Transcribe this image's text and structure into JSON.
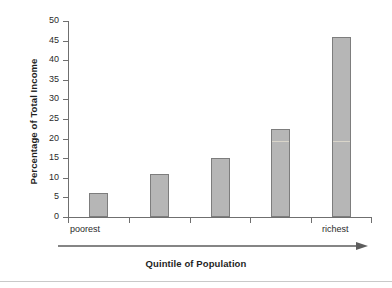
{
  "chart_data": {
    "type": "bar",
    "title": "",
    "xlabel": "Quintile of Population",
    "ylabel": "Percentage of Total Income",
    "categories": [
      "poorest",
      "",
      "",
      "",
      "richest"
    ],
    "values": [
      6,
      11,
      15,
      22.5,
      46
    ],
    "ylim": [
      0,
      50
    ],
    "ytick_labels": [
      "0",
      "5",
      "10",
      "15",
      "20",
      "25",
      "30",
      "35",
      "40",
      "45",
      "50"
    ],
    "ytick_values": [
      0,
      5,
      10,
      15,
      20,
      25,
      30,
      35,
      40,
      45,
      50
    ],
    "grid": false,
    "legend": false,
    "xaxis_end_labels": {
      "left": "poorest",
      "right": "richest"
    },
    "annotations": {
      "direction_arrow": "rightward arrow beneath x-axis"
    },
    "colors": {
      "bar_fill": "#b6b6b6",
      "bar_border": "#7d7d7d",
      "axis": "#6f6f6f",
      "text": "#2b2b2b",
      "background": "#ffffff"
    }
  }
}
